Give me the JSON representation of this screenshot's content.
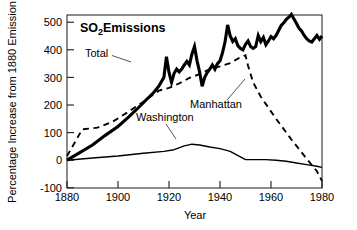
{
  "chart_data": {
    "type": "line",
    "title_main": "SO",
    "title_sub": "2",
    "title_tail": " Emissions",
    "xlabel": "Year",
    "ylabel": "Percentage Increase from 1880 Emission",
    "xlim": [
      1880,
      1980
    ],
    "ylim": [
      -100,
      530
    ],
    "xticks": [
      1880,
      1900,
      1920,
      1940,
      1960,
      1980
    ],
    "yticks": [
      -100,
      0,
      100,
      200,
      300,
      400,
      500
    ],
    "grid": false,
    "legend_position": "inline-annotations",
    "annotations": [
      {
        "name": "total",
        "text": "Total",
        "x": 1902,
        "y": 400
      },
      {
        "name": "manhattan",
        "text": "Manhattan",
        "x": 1938,
        "y": 205
      },
      {
        "name": "washington",
        "text": "Washington",
        "x": 1920,
        "y": 140
      }
    ],
    "series": [
      {
        "name": "Total",
        "style": "solid-thick",
        "color": "#000000",
        "x": [
          1880,
          1884,
          1890,
          1895,
          1900,
          1904,
          1908,
          1911,
          1914,
          1916,
          1918,
          1919,
          1920,
          1921,
          1922,
          1923,
          1924,
          1925,
          1926,
          1927,
          1928,
          1929,
          1930,
          1931,
          1932,
          1933,
          1934,
          1935,
          1936,
          1937,
          1938,
          1939,
          1940,
          1941,
          1942,
          1943,
          1944,
          1945,
          1946,
          1947,
          1948,
          1949,
          1950,
          1951,
          1952,
          1953,
          1954,
          1955,
          1956,
          1957,
          1958,
          1959,
          1960,
          1961,
          1962,
          1963,
          1964,
          1965,
          1966,
          1967,
          1968,
          1969,
          1970,
          1971,
          1972,
          1973,
          1974,
          1975,
          1976,
          1977,
          1978,
          1979,
          1980
        ],
        "y": [
          0,
          22,
          55,
          90,
          122,
          155,
          190,
          218,
          245,
          268,
          300,
          375,
          318,
          282,
          315,
          330,
          320,
          330,
          345,
          358,
          345,
          385,
          412,
          360,
          320,
          268,
          300,
          318,
          330,
          345,
          330,
          350,
          360,
          390,
          430,
          490,
          450,
          430,
          440,
          415,
          405,
          400,
          420,
          432,
          412,
          405,
          412,
          452,
          430,
          445,
          418,
          432,
          448,
          440,
          452,
          470,
          488,
          498,
          510,
          518,
          528,
          512,
          495,
          478,
          468,
          452,
          440,
          432,
          428,
          440,
          452,
          438,
          450
        ]
      },
      {
        "name": "Manhattan",
        "style": "dashed",
        "color": "#000000",
        "x": [
          1880,
          1886,
          1892,
          1898,
          1904,
          1910,
          1916,
          1920,
          1924,
          1928,
          1932,
          1936,
          1940,
          1944,
          1947,
          1950,
          1951,
          1953,
          1956,
          1962,
          1968,
          1974,
          1978,
          1980
        ],
        "y": [
          15,
          112,
          118,
          140,
          175,
          212,
          252,
          262,
          278,
          298,
          312,
          330,
          340,
          352,
          368,
          380,
          342,
          282,
          230,
          150,
          75,
          5,
          -40,
          -75
        ]
      },
      {
        "name": "Washington",
        "style": "solid-thin",
        "color": "#000000",
        "x": [
          1880,
          1890,
          1900,
          1910,
          1918,
          1922,
          1926,
          1929,
          1932,
          1936,
          1940,
          1944,
          1948,
          1950,
          1954,
          1958,
          1962,
          1966,
          1970,
          1974,
          1978,
          1980
        ],
        "y": [
          0,
          8,
          15,
          25,
          32,
          38,
          52,
          58,
          55,
          48,
          42,
          32,
          12,
          2,
          2,
          2,
          0,
          -4,
          -10,
          -16,
          -22,
          -26
        ]
      }
    ]
  },
  "axes": {
    "x_tick_labels": [
      "1880",
      "1900",
      "1920",
      "1940",
      "1960",
      "1980"
    ],
    "y_tick_labels": [
      "500",
      "400",
      "300",
      "200",
      "100",
      "0",
      "-100"
    ],
    "x_axis_title": "Year",
    "y_axis_title": "Percentage Increase from 1880 Emission"
  },
  "title": {
    "main": "SO",
    "subscript": "2",
    "tail": " Emissions"
  },
  "labels": {
    "total": "Total",
    "manhattan": "Manhattan",
    "washington": "Washington"
  }
}
